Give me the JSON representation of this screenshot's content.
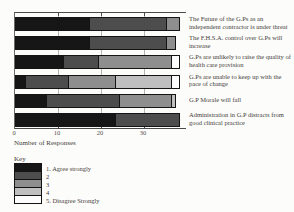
{
  "chart_data": {
    "type": "bar",
    "variant": "horizontal-stacked",
    "xlabel": "Number of Responses",
    "x_ticks": [
      0,
      10,
      20,
      30
    ],
    "xlim": [
      0,
      39.5
    ],
    "grid": "vertical-at-ticks",
    "legend_position": "bottom-left",
    "categories": [
      "The Future of the G.Ps as an independent contractor is under threat",
      "The F.H.S.A. control over G.Ps will increase",
      "G.Ps are unlikely to raise the quality of health care provision",
      "G.Ps are unable to keep up with the pace of change",
      "G.P Morale will fall",
      "Administration in G.P distracts from good clinical practice"
    ],
    "series": [
      {
        "name": "1. Agree strongly",
        "color": "#161616",
        "values": [
          17,
          17,
          11,
          2,
          7,
          23
        ]
      },
      {
        "name": "2",
        "color": "#4d4d4d",
        "values": [
          18,
          18,
          8,
          10,
          17,
          15
        ]
      },
      {
        "name": "3",
        "color": "#8e8e8e",
        "values": [
          3,
          2,
          17,
          11,
          12,
          0
        ]
      },
      {
        "name": "4",
        "color": "#bfbfbf",
        "values": [
          0,
          0,
          0,
          13,
          1,
          0
        ]
      },
      {
        "name": "5. Disagree Strongly",
        "color": "#fcfcfc",
        "values": [
          0,
          0,
          2,
          2,
          0,
          0
        ]
      }
    ],
    "legend": {
      "title": "Key",
      "entries": [
        {
          "label": "1. Agree strongly",
          "color": "#161616"
        },
        {
          "label": "2",
          "color": "#4d4d4d"
        },
        {
          "label": "3",
          "color": "#8e8e8e"
        },
        {
          "label": "4",
          "color": "#bfbfbf"
        },
        {
          "label": "5. Disagree Strongly",
          "color": "#fcfcfc"
        }
      ]
    }
  }
}
